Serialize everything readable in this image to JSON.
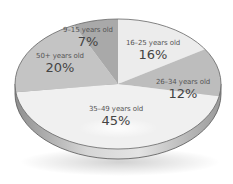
{
  "chart_data": {
    "type": "pie",
    "title": "",
    "categories": [
      "9–15 years old",
      "16–25 years old",
      "26–34 years old",
      "35–49 years old",
      "50+ years old"
    ],
    "values": [
      7,
      16,
      12,
      45,
      20
    ],
    "value_labels": [
      "7%",
      "16%",
      "12%",
      "45%",
      "20%"
    ],
    "colors": [
      "#a9a9a9",
      "#ececec",
      "#bdbdbd",
      "#f0f0f0",
      "#c4c4c4"
    ],
    "style": "3d-tilted",
    "legend": "none (labels inside slices)"
  },
  "labels": [
    {
      "cat": "9–15 years old",
      "pct": "7%"
    },
    {
      "cat": "16–25 years old",
      "pct": "16%"
    },
    {
      "cat": "26–34 years old",
      "pct": "12%"
    },
    {
      "cat": "35–49 years old",
      "pct": "45%"
    },
    {
      "cat": "50+ years old",
      "pct": "20%"
    }
  ]
}
